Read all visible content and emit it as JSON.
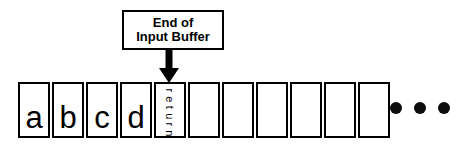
{
  "diagram": {
    "annotation": {
      "line1": "End of",
      "line2": "Input Buffer",
      "arrow_icon": "arrow-down-icon",
      "points_to_cell_index": 5
    },
    "buffer": {
      "cell_count": 11,
      "cells": [
        {
          "label": "a",
          "orientation": "horizontal",
          "filled": true
        },
        {
          "label": "b",
          "orientation": "horizontal",
          "filled": true
        },
        {
          "label": "c",
          "orientation": "horizontal",
          "filled": true
        },
        {
          "label": "d",
          "orientation": "horizontal",
          "filled": true
        },
        {
          "label": "return",
          "orientation": "vertical",
          "filled": true
        },
        {
          "label": "",
          "orientation": "horizontal",
          "filled": false
        },
        {
          "label": "",
          "orientation": "horizontal",
          "filled": false
        },
        {
          "label": "",
          "orientation": "horizontal",
          "filled": false
        },
        {
          "label": "",
          "orientation": "horizontal",
          "filled": false
        },
        {
          "label": "",
          "orientation": "horizontal",
          "filled": false
        },
        {
          "label": "",
          "orientation": "horizontal",
          "filled": false
        }
      ]
    },
    "continuation": {
      "icon": "ellipsis-dots-icon",
      "dot_count": 3
    },
    "colors": {
      "stroke": "#000000",
      "fill": "#ffffff",
      "dot": "#0d0d0d"
    }
  }
}
